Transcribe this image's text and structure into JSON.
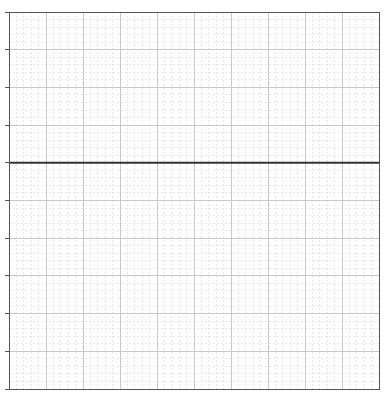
{
  "chart_data": {
    "type": "line",
    "title": "",
    "xlabel": "",
    "ylabel": "",
    "series": [
      {
        "name": "",
        "x": [
          0,
          10
        ],
        "values": [
          6,
          6
        ],
        "color": "#333333",
        "line_width": 2
      }
    ],
    "xlim": [
      0,
      10
    ],
    "ylim": [
      0,
      10
    ],
    "x_major_ticks": [
      0,
      1,
      2,
      3,
      4,
      5,
      6,
      7,
      8,
      9,
      10
    ],
    "y_major_ticks": [
      0,
      1,
      2,
      3,
      4,
      5,
      6,
      7,
      8,
      9,
      10
    ],
    "x_tick_labels": [],
    "y_tick_labels": [],
    "minor_divisions": 5,
    "grid": true,
    "legend": null
  },
  "style": {
    "frame_color": "#555555",
    "major_grid_color": "#c8c8c8",
    "minor_grid_color": "#e6e6e6",
    "background": "#ffffff"
  },
  "layout": {
    "plot_left": 9,
    "plot_top": 12,
    "plot_right": 379,
    "plot_bottom": 389
  }
}
